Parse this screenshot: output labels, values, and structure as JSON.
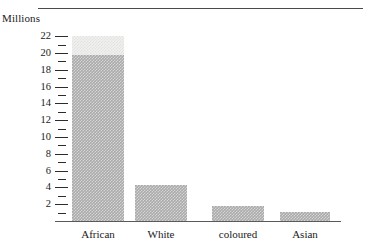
{
  "figure": {
    "unit_caption": "Millions",
    "top_rule": true
  },
  "chart_data": {
    "type": "bar",
    "title": "",
    "subtitle": "",
    "xlabel": "",
    "ylabel": "Millions",
    "categories": [
      "African",
      "White",
      "coloured",
      "Asian"
    ],
    "values": [
      22.0,
      4.3,
      1.8,
      1.1
    ],
    "series": [
      {
        "name": "Population",
        "values": [
          22.0,
          4.3,
          1.8,
          1.1
        ]
      }
    ],
    "segment_note": {
      "category": "African",
      "shaded_to": 19.8,
      "light_cap_from": 19.8,
      "light_cap_to": 22.0
    },
    "ylim": [
      0,
      22.8
    ],
    "y_major_ticks": [
      2,
      4,
      6,
      8,
      10,
      12,
      14,
      16,
      18,
      20,
      22
    ],
    "y_minor_ticks": [
      1,
      3,
      5,
      7,
      9,
      11,
      13,
      15,
      17,
      19,
      21
    ],
    "y_tick_labels": [
      "2",
      "4",
      "6",
      "8",
      "10",
      "12",
      "14",
      "16",
      "18",
      "20",
      "22"
    ],
    "grid": false,
    "legend": null,
    "legend_position": "none",
    "colors": {
      "bar_fill": "#aaaaaa",
      "bar_cap_fill": "#f0f0ee",
      "axis": "#5a5a5a",
      "tick": "#2c2c2c",
      "rule": "#4a4a4a",
      "text": "#1a1a1a"
    }
  }
}
